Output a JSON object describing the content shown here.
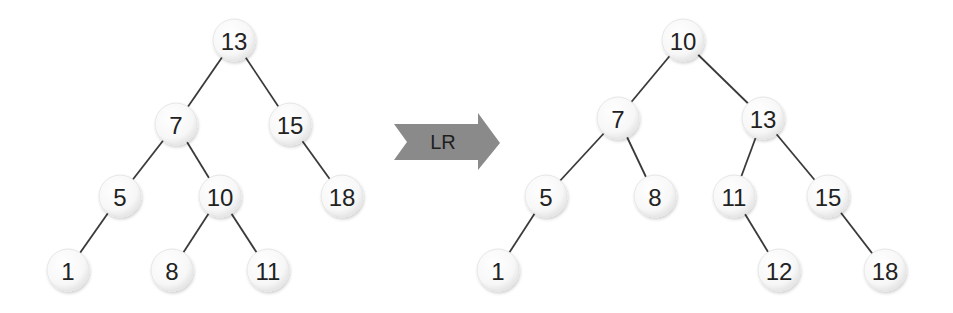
{
  "diagram": {
    "title": "",
    "operation": {
      "label": "LR",
      "color": "#8a8a8a"
    },
    "before_tree": {
      "nodes": [
        {
          "id": "b13",
          "label": "13",
          "x": 234,
          "y": 40
        },
        {
          "id": "b7",
          "label": "7",
          "x": 176,
          "y": 124
        },
        {
          "id": "b15",
          "label": "15",
          "x": 290,
          "y": 124
        },
        {
          "id": "b5",
          "label": "5",
          "x": 120,
          "y": 196
        },
        {
          "id": "b10",
          "label": "10",
          "x": 220,
          "y": 196
        },
        {
          "id": "b18",
          "label": "18",
          "x": 342,
          "y": 196
        },
        {
          "id": "b1",
          "label": "1",
          "x": 68,
          "y": 270
        },
        {
          "id": "b8",
          "label": "8",
          "x": 172,
          "y": 270
        },
        {
          "id": "b11",
          "label": "11",
          "x": 268,
          "y": 270
        }
      ],
      "edges": [
        [
          "b13",
          "b7"
        ],
        [
          "b13",
          "b15"
        ],
        [
          "b7",
          "b5"
        ],
        [
          "b7",
          "b10"
        ],
        [
          "b15",
          "b18"
        ],
        [
          "b5",
          "b1"
        ],
        [
          "b10",
          "b8"
        ],
        [
          "b10",
          "b11"
        ]
      ]
    },
    "after_tree": {
      "nodes": [
        {
          "id": "a10",
          "label": "10",
          "x": 683,
          "y": 40
        },
        {
          "id": "a7",
          "label": "7",
          "x": 618,
          "y": 118
        },
        {
          "id": "a13",
          "label": "13",
          "x": 763,
          "y": 118
        },
        {
          "id": "a5",
          "label": "5",
          "x": 546,
          "y": 196
        },
        {
          "id": "a8",
          "label": "8",
          "x": 655,
          "y": 196
        },
        {
          "id": "a11",
          "label": "11",
          "x": 734,
          "y": 196
        },
        {
          "id": "a15",
          "label": "15",
          "x": 828,
          "y": 196
        },
        {
          "id": "a1",
          "label": "1",
          "x": 498,
          "y": 270
        },
        {
          "id": "a12",
          "label": "12",
          "x": 779,
          "y": 270
        },
        {
          "id": "a18",
          "label": "18",
          "x": 885,
          "y": 270
        }
      ],
      "edges": [
        [
          "a10",
          "a7"
        ],
        [
          "a10",
          "a13"
        ],
        [
          "a7",
          "a5"
        ],
        [
          "a7",
          "a8"
        ],
        [
          "a13",
          "a11"
        ],
        [
          "a13",
          "a15"
        ],
        [
          "a5",
          "a1"
        ],
        [
          "a11",
          "a12"
        ],
        [
          "a15",
          "a18"
        ]
      ]
    }
  }
}
